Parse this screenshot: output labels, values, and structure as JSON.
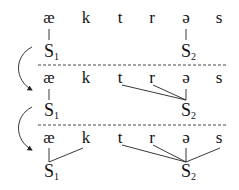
{
  "diagram": {
    "segments": [
      "æ",
      "k",
      "t",
      "r",
      "ə",
      "s"
    ],
    "syllable_label": "S",
    "syllable_subscripts": [
      "1",
      "2"
    ],
    "stages": [
      {
        "name": "nucleus",
        "S1": [
          "æ"
        ],
        "S2": [
          "ə"
        ]
      },
      {
        "name": "onset",
        "S1": [
          "æ"
        ],
        "S2": [
          "t",
          "r",
          "ə"
        ]
      },
      {
        "name": "coda",
        "S1": [
          "æ",
          "k"
        ],
        "S2": [
          "t",
          "r",
          "ə",
          "s"
        ]
      }
    ]
  }
}
